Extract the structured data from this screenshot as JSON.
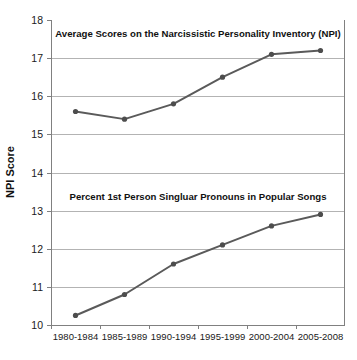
{
  "chart_data": {
    "type": "line",
    "title": "",
    "xlabel": "",
    "ylabel": "NPI Score",
    "ylim": [
      10,
      18
    ],
    "yticks": [
      "10",
      "11",
      "12",
      "13",
      "14",
      "15",
      "16",
      "17",
      "18"
    ],
    "grid": true,
    "legend": "none",
    "categories": [
      "1980-1984",
      "1985-1989",
      "1990-1994",
      "1995-1999",
      "2000-2004",
      "2005-2008"
    ],
    "series": [
      {
        "name": "Average Scores on the Narcissistic Personality Inventory (NPI)",
        "values": [
          15.6,
          15.4,
          15.8,
          16.5,
          17.1,
          17.2
        ]
      },
      {
        "name": "Percent 1st Person Singluar Pronouns in Popular Songs",
        "values": [
          10.25,
          10.8,
          11.6,
          12.1,
          12.6,
          12.9
        ]
      }
    ],
    "annotations": [
      "Average Scores on the Narcissistic Personality Inventory (NPI)",
      "Percent 1st Person Singluar Pronouns in Popular Songs"
    ],
    "colors": {
      "line": "#5a5a5a",
      "marker": "#4d4d4d",
      "grid": "#b3b3b3",
      "axis": "#808080",
      "background": "#ffffff",
      "text": "#111111"
    }
  },
  "panels": {
    "upper_title": "Average Scores on the Narcissistic Personality Inventory (NPI)",
    "lower_title": "Percent 1st Person Singluar Pronouns in Popular Songs"
  },
  "axis": {
    "y_label": "NPI Score",
    "y_ticks": [
      "18",
      "17",
      "16",
      "15",
      "14",
      "13",
      "12",
      "11",
      "10"
    ],
    "x_ticks": [
      "1980-1984",
      "1985-1989",
      "1990-1994",
      "1995-1999",
      "2000-2004",
      "2005-2008"
    ]
  }
}
